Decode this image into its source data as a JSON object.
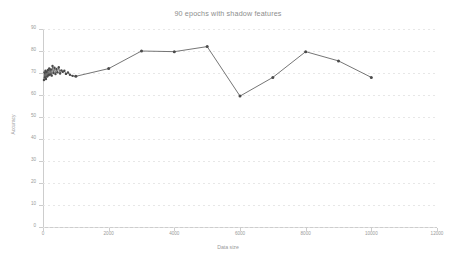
{
  "chart_data": {
    "type": "line",
    "title": "90 epochs with shadow features",
    "xlabel": "Data size",
    "ylabel": "Accuracy",
    "xlim": [
      0,
      12000
    ],
    "ylim": [
      0,
      90
    ],
    "grid": true,
    "legend": "none",
    "marker": "round-dot",
    "line_color": "#5c5c5c",
    "marker_color": "#4a4a4a",
    "grid_color": "#e3e3e3",
    "axis_color": "#cdcdcd",
    "text_color": "#9a9a9a",
    "xticks": [
      0,
      2000,
      4000,
      6000,
      8000,
      10000,
      12000
    ],
    "xtick_labels": [
      "0",
      "2000",
      "4000",
      "6000",
      "8000",
      "10000",
      "12000"
    ],
    "yticks": [
      0,
      10,
      20,
      30,
      40,
      50,
      60,
      70,
      80,
      90
    ],
    "ytick_labels": [
      "0",
      "10",
      "20",
      "30",
      "40",
      "50",
      "60",
      "70",
      "80",
      "90"
    ],
    "series": [
      {
        "name": "accuracy",
        "points": [
          [
            30,
            66.8
          ],
          [
            45,
            70.2
          ],
          [
            60,
            68.0
          ],
          [
            75,
            71.0
          ],
          [
            90,
            67.3
          ],
          [
            110,
            70.6
          ],
          [
            130,
            68.4
          ],
          [
            150,
            71.4
          ],
          [
            170,
            69.0
          ],
          [
            190,
            72.1
          ],
          [
            215,
            69.3
          ],
          [
            240,
            71.6
          ],
          [
            265,
            68.8
          ],
          [
            290,
            73.2
          ],
          [
            320,
            70.0
          ],
          [
            350,
            72.4
          ],
          [
            380,
            69.5
          ],
          [
            410,
            71.8
          ],
          [
            440,
            70.3
          ],
          [
            480,
            72.6
          ],
          [
            520,
            69.8
          ],
          [
            560,
            71.2
          ],
          [
            600,
            70.5
          ],
          [
            650,
            71.0
          ],
          [
            700,
            69.6
          ],
          [
            760,
            70.2
          ],
          [
            820,
            69.2
          ],
          [
            900,
            68.7
          ],
          [
            1000,
            68.5
          ],
          [
            2000,
            72.0
          ],
          [
            3000,
            80.0
          ],
          [
            4000,
            79.7
          ],
          [
            5000,
            82.0
          ],
          [
            6000,
            59.5
          ],
          [
            7000,
            68.0
          ],
          [
            8000,
            79.7
          ],
          [
            9000,
            75.5
          ],
          [
            10000,
            68.0
          ]
        ]
      }
    ]
  }
}
